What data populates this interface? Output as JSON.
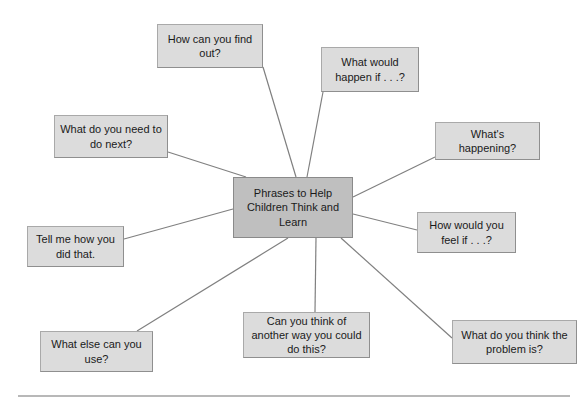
{
  "diagram": {
    "type": "mind-map",
    "center": {
      "id": "center",
      "label": "Phrases to Help Children Think and Learn",
      "fill": "#bfbfbf",
      "x": 233,
      "y": 177,
      "w": 120,
      "h": 61
    },
    "nodes": [
      {
        "id": "how-can-you-find-out",
        "label": "How can you find out?",
        "fill": "#dcdcdc",
        "x": 157,
        "y": 24,
        "w": 106,
        "h": 44
      },
      {
        "id": "what-would-happen-if",
        "label": "What would happen if . . .?",
        "fill": "#dcdcdc",
        "x": 321,
        "y": 47,
        "w": 98,
        "h": 45
      },
      {
        "id": "whats-happening",
        "label": "What's happening?",
        "fill": "#dcdcdc",
        "x": 435,
        "y": 122,
        "w": 105,
        "h": 38
      },
      {
        "id": "how-would-you-feel-if",
        "label": "How would you feel if . . .?",
        "fill": "#dcdcdc",
        "x": 417,
        "y": 212,
        "w": 99,
        "h": 41
      },
      {
        "id": "what-do-you-think-the-problem-is",
        "label": "What do you think the problem is?",
        "fill": "#dcdcdc",
        "x": 452,
        "y": 320,
        "w": 125,
        "h": 44
      },
      {
        "id": "can-you-think-of-another-way",
        "label": "Can you think of another way you could do this?",
        "fill": "#dcdcdc",
        "x": 243,
        "y": 312,
        "w": 127,
        "h": 46
      },
      {
        "id": "what-else-can-you-use",
        "label": "What else can you use?",
        "fill": "#dcdcdc",
        "x": 40,
        "y": 331,
        "w": 113,
        "h": 41
      },
      {
        "id": "tell-me-how-you-did-that",
        "label": "Tell me how you did that.",
        "fill": "#dcdcdc",
        "x": 27,
        "y": 226,
        "w": 97,
        "h": 41
      },
      {
        "id": "what-do-you-need-to-do-next",
        "label": "What do you need to do next?",
        "fill": "#dcdcdc",
        "x": 54,
        "y": 115,
        "w": 114,
        "h": 43
      }
    ],
    "connectors": [
      {
        "id": "connector-how-can-you-find-out",
        "x1": 263,
        "y1": 67,
        "x2": 296,
        "y2": 177
      },
      {
        "id": "connector-what-would-happen-if",
        "x1": 323,
        "y1": 92,
        "x2": 307,
        "y2": 177
      },
      {
        "id": "connector-whats-happening",
        "x1": 435,
        "y1": 157,
        "x2": 353,
        "y2": 197
      },
      {
        "id": "connector-how-would-you-feel-if",
        "x1": 417,
        "y1": 230,
        "x2": 353,
        "y2": 214
      },
      {
        "id": "connector-what-do-you-think-the-problem-is",
        "x1": 452,
        "y1": 338,
        "x2": 341,
        "y2": 238
      },
      {
        "id": "connector-can-you-think-of-another-way",
        "x1": 315,
        "y1": 312,
        "x2": 316,
        "y2": 238
      },
      {
        "id": "connector-what-else-can-you-use",
        "x1": 137,
        "y1": 331,
        "x2": 288,
        "y2": 238
      },
      {
        "id": "connector-tell-me-how-you-did-that",
        "x1": 124,
        "y1": 239,
        "x2": 233,
        "y2": 209
      },
      {
        "id": "connector-what-do-you-need-to-do-next",
        "x1": 168,
        "y1": 152,
        "x2": 246,
        "y2": 177
      }
    ],
    "connector_color": "#808080",
    "footer_rule_color": "#b8b8b8",
    "background": "#ffffff"
  }
}
